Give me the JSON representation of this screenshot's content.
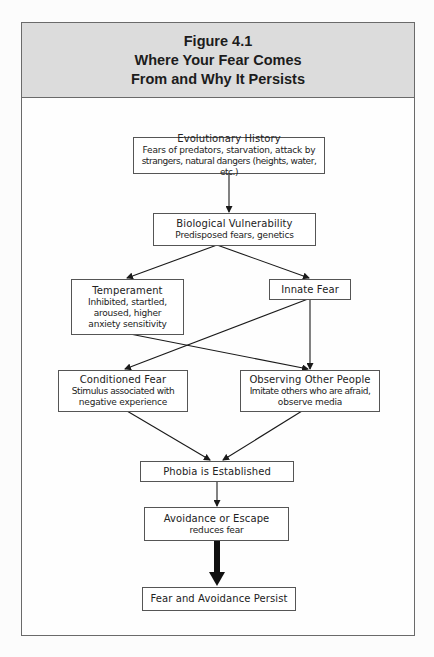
{
  "figure": {
    "label": "Figure 4.1",
    "title_line1": "Where Your Fear Comes",
    "title_line2": "From and Why It Persists"
  },
  "nodes": {
    "evolutionary_history": {
      "title": "Evolutionary History",
      "desc_line1": "Fears of predators, starvation, attack by",
      "desc_line2": "strangers, natural dangers (heights, water, etc.)"
    },
    "biological_vulnerability": {
      "title": "Biological Vulnerability",
      "desc_line1": "Predisposed fears, genetics"
    },
    "temperament": {
      "title": "Temperament",
      "desc_line1": "Inhibited, startled,",
      "desc_line2": "aroused, higher",
      "desc_line3": "anxiety sensitivity"
    },
    "innate_fear": {
      "title": "Innate Fear"
    },
    "conditioned_fear": {
      "title": "Conditioned Fear",
      "desc_line1": "Stimulus associated with",
      "desc_line2": "negative experience"
    },
    "observing_other_people": {
      "title": "Observing Other People",
      "desc_line1": "Imitate others who are afraid,",
      "desc_line2": "observe media"
    },
    "phobia_established": {
      "title": "Phobia is Established"
    },
    "avoidance_escape": {
      "title": "Avoidance or Escape",
      "desc_line1": "reduces fear"
    },
    "fear_avoidance_persist": {
      "title": "Fear and Avoidance Persist"
    }
  },
  "edges": [
    {
      "from": "Evolutionary History",
      "to": "Biological Vulnerability"
    },
    {
      "from": "Biological Vulnerability",
      "to": "Temperament"
    },
    {
      "from": "Biological Vulnerability",
      "to": "Innate Fear"
    },
    {
      "from": "Temperament",
      "to": "Observing Other People"
    },
    {
      "from": "Innate Fear",
      "to": "Conditioned Fear"
    },
    {
      "from": "Innate Fear",
      "to": "Observing Other People"
    },
    {
      "from": "Conditioned Fear",
      "to": "Phobia is Established"
    },
    {
      "from": "Observing Other People",
      "to": "Phobia is Established"
    },
    {
      "from": "Phobia is Established",
      "to": "Avoidance or Escape"
    },
    {
      "from": "Avoidance or Escape",
      "to": "Fear and Avoidance Persist",
      "style": "bold"
    }
  ],
  "colors": {
    "header_bg": "#dcdcdc",
    "border": "#555555",
    "line": "#1a1a1a"
  }
}
